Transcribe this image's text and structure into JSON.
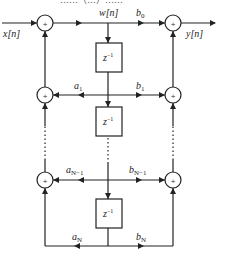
{
  "header_fragment": "……（…）……",
  "diagram": {
    "input_label": "x[n]",
    "output_label": "y[n]",
    "state_label": "w[n]",
    "delay_label": "z",
    "delay_exp": "−1",
    "adder_symbol": "+",
    "coefficients": {
      "b0": {
        "base": "b",
        "sub": "0"
      },
      "a1": {
        "base": "a",
        "sub": "1"
      },
      "b1": {
        "base": "b",
        "sub": "1"
      },
      "aN1": {
        "base": "a",
        "sub": "N−1"
      },
      "bN1": {
        "base": "b",
        "sub": "N−1"
      },
      "aN": {
        "base": "a",
        "sub": "N"
      },
      "bN": {
        "base": "b",
        "sub": "N"
      }
    },
    "ellipsis": "⋮"
  }
}
